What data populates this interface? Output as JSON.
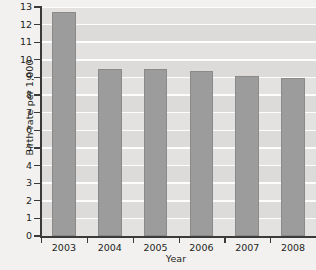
{
  "chart_data": {
    "type": "bar",
    "title": "",
    "xlabel": "Year",
    "ylabel": "Birth rate per 1,000",
    "categories": [
      "2003",
      "2004",
      "2005",
      "2006",
      "2007",
      "2008"
    ],
    "values": [
      12.7,
      9.5,
      9.5,
      9.35,
      9.1,
      8.95
    ],
    "ylim": [
      0,
      13
    ],
    "ytick_labels": [
      "0",
      "1",
      "2",
      "3",
      "4",
      "5",
      "6",
      "7",
      "8",
      "9",
      "10",
      "11",
      "12",
      "13"
    ],
    "ytick_values": [
      0,
      1,
      2,
      3,
      4,
      5,
      6,
      7,
      8,
      9,
      10,
      11,
      12,
      13
    ],
    "grid": true,
    "legend": false,
    "bar_color": "#9c9c9c",
    "bar_edge_color": "#8a8a8a",
    "plot_background": "#e3e2e1",
    "gridline_color": "#fdfdfd",
    "axis_color": "#3a3a3a",
    "page_background": "#f2f1f0"
  }
}
